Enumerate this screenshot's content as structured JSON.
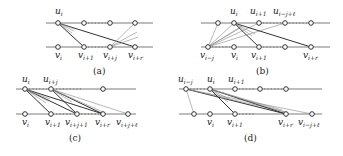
{
  "figure": {
    "panels": [
      {
        "id": "a",
        "caption": "(a)",
        "top_labels": [
          {
            "base": "u",
            "sub": "i",
            "x": 55,
            "y": 14
          }
        ],
        "bottom_labels": [
          {
            "base": "v",
            "sub": "i",
            "x": 55,
            "y": 58
          },
          {
            "base": "v",
            "sub": "i+1",
            "x": 78,
            "y": 58
          },
          {
            "base": "v",
            "sub": "i+j",
            "x": 103,
            "y": 58
          },
          {
            "base": "v",
            "sub": "i+r",
            "x": 128,
            "y": 58
          }
        ]
      },
      {
        "id": "b",
        "caption": "(b)",
        "top_labels": [
          {
            "base": "u",
            "sub": "i",
            "x": 230,
            "y": 14
          },
          {
            "base": "u",
            "sub": "i+1",
            "x": 250,
            "y": 14
          },
          {
            "base": "u",
            "sub": "i−j+ℓ",
            "x": 273,
            "y": 14
          }
        ],
        "bottom_labels": [
          {
            "base": "v",
            "sub": "i−j",
            "x": 200,
            "y": 58
          },
          {
            "base": "v",
            "sub": "i",
            "x": 231,
            "y": 58
          },
          {
            "base": "v",
            "sub": "i+1",
            "x": 251,
            "y": 58
          },
          {
            "base": "v",
            "sub": "i+r",
            "x": 303,
            "y": 58
          }
        ]
      },
      {
        "id": "c",
        "caption": "(c)",
        "top_labels": [
          {
            "base": "u",
            "sub": "i",
            "x": 22,
            "y": 82
          },
          {
            "base": "u",
            "sub": "i+j",
            "x": 43,
            "y": 82
          }
        ],
        "bottom_labels": [
          {
            "base": "v",
            "sub": "i",
            "x": 22,
            "y": 125
          },
          {
            "base": "v",
            "sub": "i+1",
            "x": 45,
            "y": 125
          },
          {
            "base": "v",
            "sub": "i+j+1",
            "x": 65,
            "y": 125
          },
          {
            "base": "v",
            "sub": "i+r",
            "x": 95,
            "y": 125
          },
          {
            "base": "v",
            "sub": "i+j+ℓ",
            "x": 116,
            "y": 125
          }
        ]
      },
      {
        "id": "d",
        "caption": "(d)",
        "top_labels": [
          {
            "base": "u",
            "sub": "i−j",
            "x": 178,
            "y": 82
          },
          {
            "base": "u",
            "sub": "i",
            "x": 207,
            "y": 82
          },
          {
            "base": "u",
            "sub": "i+1",
            "x": 228,
            "y": 82
          }
        ],
        "bottom_labels": [
          {
            "base": "v",
            "sub": "i",
            "x": 207,
            "y": 125
          },
          {
            "base": "v",
            "sub": "i+1",
            "x": 227,
            "y": 125
          },
          {
            "base": "v",
            "sub": "i+r",
            "x": 278,
            "y": 125
          },
          {
            "base": "v",
            "sub": "i−j+ℓ",
            "x": 298,
            "y": 125
          }
        ]
      }
    ],
    "colors": {
      "rail": "#bdbdbd",
      "edge": "#333333",
      "edge_light": "#888888",
      "node_fill": "#ffffff",
      "node_stroke": "#333333"
    }
  }
}
